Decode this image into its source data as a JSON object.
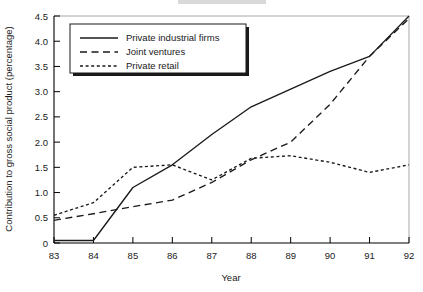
{
  "chart_data": {
    "type": "line",
    "title": "",
    "xlabel": "Year",
    "ylabel": "Contribution to gross social product (percentage)",
    "x": [
      83,
      84,
      85,
      86,
      87,
      88,
      89,
      90,
      91,
      92
    ],
    "categories": [
      "83",
      "84",
      "85",
      "86",
      "87",
      "88",
      "89",
      "90",
      "91",
      "92"
    ],
    "xlim": [
      83,
      92
    ],
    "ylim": [
      0,
      4.5
    ],
    "ytick_labels": [
      "0",
      "0.5",
      "1.0",
      "1.5",
      "2.0",
      "2.5",
      "3.0",
      "3.5",
      "4.0",
      "4.5"
    ],
    "ytick_values": [
      0,
      0.5,
      1.0,
      1.5,
      2.0,
      2.5,
      3.0,
      3.5,
      4.0,
      4.5
    ],
    "grid": false,
    "legend_position": "upper-left-inside",
    "series": [
      {
        "name": "Private industrial firms",
        "style": "solid",
        "values": [
          0.05,
          0.05,
          1.1,
          1.55,
          2.15,
          2.7,
          3.05,
          3.4,
          3.7,
          4.5
        ]
      },
      {
        "name": "Joint ventures",
        "style": "dashed",
        "values": [
          0.45,
          0.58,
          0.72,
          0.85,
          1.2,
          1.65,
          2.0,
          2.75,
          3.7,
          4.45
        ]
      },
      {
        "name": "Private retail",
        "style": "dotted",
        "values": [
          0.55,
          0.8,
          1.5,
          1.55,
          1.25,
          1.68,
          1.73,
          1.6,
          1.4,
          1.55
        ]
      }
    ]
  },
  "axes": {
    "x_title": "Year",
    "y_title": "Contribution to gross social product (percentage)"
  },
  "legend": {
    "items": [
      {
        "label": "Private industrial firms",
        "style": "solid"
      },
      {
        "label": "Joint ventures",
        "style": "dashed"
      },
      {
        "label": "Private retail",
        "style": "dotted"
      }
    ]
  }
}
